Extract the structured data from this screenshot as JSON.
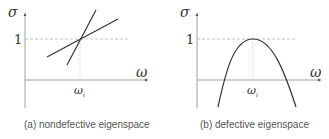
{
  "panels": [
    {
      "id": "a",
      "caption": "(a) nondefective eigenspace",
      "y_axis_label": "σ",
      "x_axis_label": "ω",
      "y_tick_label": "1",
      "x_tick_label": "ω",
      "x_tick_subscript": "i",
      "curve_type": "two crossing lines intersecting at (ω_i, 1)"
    },
    {
      "id": "b",
      "caption": "(b) defective eigenspace",
      "y_axis_label": "σ",
      "x_axis_label": "ω",
      "y_tick_label": "1",
      "x_tick_label": "ω",
      "x_tick_subscript": "i",
      "curve_type": "downward parabola with maximum 1 at ω_i"
    }
  ],
  "colors": {
    "axis": "#888888",
    "curve": "#333333",
    "dashed": "#aaaaaa",
    "text": "#333333"
  }
}
